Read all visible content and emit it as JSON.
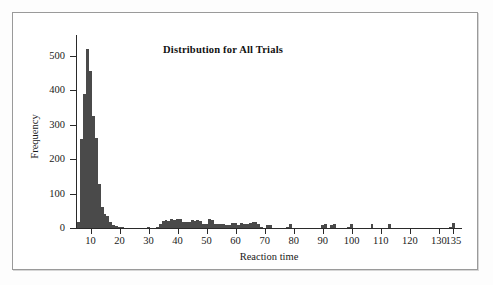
{
  "chart_data": {
    "type": "bar",
    "title": "Distribution for All Trials",
    "xlabel": "Reaction time",
    "ylabel": "Frequency",
    "xlim": [
      5,
      138
    ],
    "ylim": [
      0,
      560
    ],
    "grid": false,
    "legend": null,
    "bin_width": 1,
    "x_ticks": [
      10,
      20,
      30,
      40,
      50,
      60,
      70,
      80,
      90,
      100,
      110,
      120,
      130,
      135
    ],
    "y_ticks": [
      0,
      100,
      200,
      300,
      400,
      500
    ],
    "x_tick_labels": [
      "10",
      "20",
      "30",
      "40",
      "50",
      "60",
      "70",
      "80",
      "90",
      "100",
      "110",
      "120",
      "130",
      "135"
    ],
    "y_tick_labels": [
      "0",
      "100",
      "200",
      "300",
      "400",
      "500"
    ],
    "categories": [
      6,
      7,
      8,
      9,
      10,
      11,
      12,
      13,
      14,
      15,
      16,
      17,
      18,
      19,
      20,
      21,
      30,
      33,
      34,
      35,
      36,
      37,
      38,
      39,
      40,
      41,
      42,
      43,
      44,
      45,
      46,
      47,
      48,
      49,
      50,
      51,
      52,
      53,
      54,
      55,
      56,
      57,
      58,
      59,
      60,
      61,
      62,
      63,
      64,
      65,
      66,
      67,
      68,
      69,
      71,
      72,
      78,
      79,
      90,
      91,
      93,
      94,
      99,
      100,
      107,
      113,
      134,
      135
    ],
    "values": [
      18,
      258,
      390,
      520,
      455,
      325,
      262,
      128,
      62,
      40,
      34,
      18,
      8,
      5,
      3,
      2,
      3,
      3,
      12,
      20,
      22,
      21,
      26,
      24,
      27,
      26,
      18,
      17,
      17,
      22,
      21,
      22,
      21,
      12,
      12,
      25,
      24,
      13,
      12,
      11,
      11,
      10,
      8,
      14,
      14,
      9,
      15,
      12,
      12,
      15,
      17,
      17,
      13,
      3,
      10,
      10,
      3,
      12,
      8,
      13,
      8,
      12,
      3,
      13,
      12,
      13,
      3,
      15
    ],
    "bar_color": "#4a4a4a",
    "axis_color": "#2a2a2a",
    "background": "#ffffff"
  },
  "figure": {
    "frame_border_color": "#9a9a9a",
    "page_background": "#fdfdfd"
  }
}
